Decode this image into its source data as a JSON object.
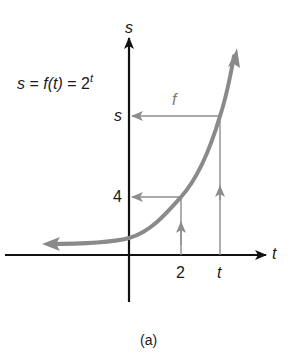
{
  "figure": {
    "equation": {
      "lhs": "s",
      "eq1": " = ",
      "fn": "f",
      "arg": "(t)",
      "eq2": " = 2",
      "exponent": "t"
    },
    "axis_labels": {
      "y": "s",
      "x": "t"
    },
    "y_ticks": [
      {
        "label": "s"
      },
      {
        "label": "4"
      }
    ],
    "x_ticks": [
      {
        "label": "2"
      },
      {
        "label": "t"
      }
    ],
    "function_label": "f",
    "caption": "(a)",
    "colors": {
      "axes": "#111111",
      "curve": "#8a8a8a",
      "guides": "#8c8c8c",
      "text": "#1a1a1a"
    }
  }
}
